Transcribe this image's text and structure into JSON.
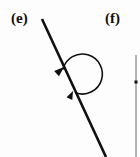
{
  "figure": {
    "background_color": "#fdfdfd",
    "stroke_color": "#101010",
    "width": 140,
    "height": 157
  },
  "panels": {
    "e": {
      "label": "(e)",
      "label_x": 11,
      "label_y": 11,
      "elements": {
        "straight_line": {
          "name": "diagonal-line",
          "x1": 42,
          "y1": 19,
          "x2": 106,
          "y2": 157,
          "stroke_width": 2.6
        },
        "rotation_arc": {
          "name": "rotation-arc",
          "description": "near-full circular arc bulging left from lower point on line, ending in arrowhead on the line above",
          "start_x": 76,
          "start_y": 93,
          "end_x": 63,
          "end_y": 69,
          "radius_x": 20,
          "radius_y": 20,
          "sweep": 0,
          "large_arc": 1,
          "stroke_width": 1.6
        },
        "arc_arrowhead": {
          "name": "arc-arrowhead",
          "tip_x": 64,
          "tip_y": 67,
          "direction_deg": 42
        },
        "line_marker": {
          "name": "line-direction-arrowhead",
          "tip_x": 73,
          "tip_y": 91,
          "direction_deg": 65
        }
      }
    },
    "f": {
      "label": "(f)",
      "label_x": 105,
      "label_y": 11,
      "elements": {
        "vertical_line": {
          "name": "vertical-line",
          "x1": 136,
          "y1": 55,
          "x2": 136,
          "y2": 157,
          "stroke_width": 1.0
        },
        "vertical_line_marker": {
          "name": "vertical-line-marker",
          "x": 136,
          "y": 82,
          "size": 3
        }
      }
    }
  }
}
